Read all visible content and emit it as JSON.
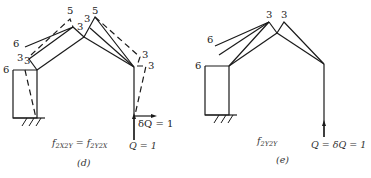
{
  "figure_d": {
    "caption": "(d)",
    "equation_lhs": "f",
    "equation_lhs_sub": "2X2Y",
    "equation_eq": " = ",
    "equation_rhs": "f",
    "equation_rhs_sub": "2Y2X",
    "load_label_vertical": "Q = 1",
    "load_label_horizontal": "δQ = 1",
    "node_labels": {
      "left_outer_top": "6",
      "left_upper_member": "6",
      "left_upper_inner_1": "3",
      "left_upper_inner_2": "3",
      "apex_left_dashed": "5",
      "apex_left_solid": "3",
      "apex_right_label_a": "3",
      "apex_right_dashed": "5",
      "right_joint_dashed": "3",
      "right_joint_offset": "3"
    }
  },
  "figure_e": {
    "caption": "(e)",
    "equation": "f",
    "equation_sub": "2Y2Y",
    "load_label": "Q = δQ = 1",
    "node_labels": {
      "left_outer_top": "6",
      "left_upper_member": "6",
      "apex_left": "3",
      "apex_right": "3"
    }
  }
}
